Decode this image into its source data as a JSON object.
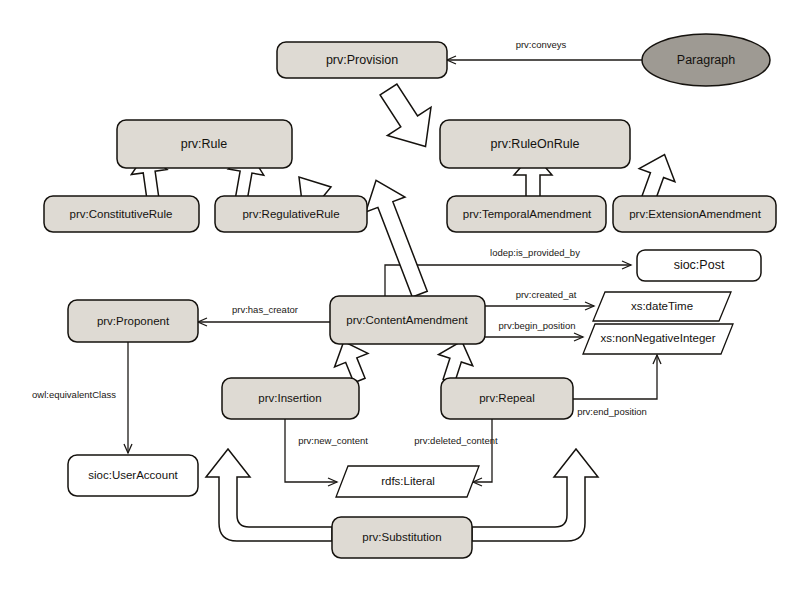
{
  "diagram": {
    "colors": {
      "class_fill": "#dedad3",
      "external_fill": "#ffffff",
      "individual_fill": "#9e9a93",
      "stroke": "#15120e",
      "background": "#ffffff"
    },
    "nodes": [
      {
        "id": "provision",
        "label": "prv:Provision",
        "shape": "rounded-rect",
        "fill": "class"
      },
      {
        "id": "paragraph",
        "label": "Paragraph",
        "shape": "ellipse",
        "fill": "individual"
      },
      {
        "id": "rule",
        "label": "prv:Rule",
        "shape": "rounded-rect",
        "fill": "class"
      },
      {
        "id": "ruleonrule",
        "label": "prv:RuleOnRule",
        "shape": "rounded-rect",
        "fill": "class"
      },
      {
        "id": "constitutiverule",
        "label": "prv:ConstitutiveRule",
        "shape": "rounded-rect",
        "fill": "class"
      },
      {
        "id": "regulativerule",
        "label": "prv:RegulativeRule",
        "shape": "rounded-rect",
        "fill": "class"
      },
      {
        "id": "temporalamendment",
        "label": "prv:TemporalAmendment",
        "shape": "rounded-rect",
        "fill": "class"
      },
      {
        "id": "extensionamendment",
        "label": "prv:ExtensionAmendment",
        "shape": "rounded-rect",
        "fill": "class"
      },
      {
        "id": "siocpost",
        "label": "sioc:Post",
        "shape": "rounded-rect",
        "fill": "external"
      },
      {
        "id": "contentamendment",
        "label": "prv:ContentAmendment",
        "shape": "rounded-rect",
        "fill": "class"
      },
      {
        "id": "proponent",
        "label": "prv:Proponent",
        "shape": "rounded-rect",
        "fill": "class"
      },
      {
        "id": "xsdatetime",
        "label": "xs:dateTime",
        "shape": "parallelogram",
        "fill": "external"
      },
      {
        "id": "xsnonnegativeinteger",
        "label": "xs:nonNegativeInteger",
        "shape": "parallelogram",
        "fill": "external"
      },
      {
        "id": "siocuseraccount",
        "label": "sioc:UserAccount",
        "shape": "rounded-rect",
        "fill": "external"
      },
      {
        "id": "insertion",
        "label": "prv:Insertion",
        "shape": "rounded-rect",
        "fill": "class"
      },
      {
        "id": "repeal",
        "label": "prv:Repeal",
        "shape": "rounded-rect",
        "fill": "class"
      },
      {
        "id": "rdfsliteral",
        "label": "rdfs:Literal",
        "shape": "parallelogram",
        "fill": "external"
      },
      {
        "id": "substitution",
        "label": "prv:Substitution",
        "shape": "rounded-rect",
        "fill": "class"
      }
    ],
    "edges": [
      {
        "id": "conveys",
        "label": "prv:conveys",
        "from": "paragraph",
        "to": "provision",
        "type": "association"
      },
      {
        "id": "is_provided_by",
        "label": "lodep:is_provided_by",
        "from": "contentamendment",
        "to": "siocpost",
        "type": "association"
      },
      {
        "id": "created_at",
        "label": "prv:created_at",
        "from": "contentamendment",
        "to": "xsdatetime",
        "type": "association"
      },
      {
        "id": "begin_position",
        "label": "prv:begin_position",
        "from": "contentamendment",
        "to": "xsnonnegativeinteger",
        "type": "association"
      },
      {
        "id": "end_position",
        "label": "prv:end_position",
        "from": "repeal",
        "to": "xsnonnegativeinteger",
        "type": "association"
      },
      {
        "id": "has_creator",
        "label": "prv:has_creator",
        "from": "contentamendment",
        "to": "proponent",
        "type": "association"
      },
      {
        "id": "equivalent_class",
        "label": "owl:equivalentClass",
        "from": "proponent",
        "to": "siocuseraccount",
        "type": "association"
      },
      {
        "id": "new_content",
        "label": "prv:new_content",
        "from": "insertion",
        "to": "rdfsliteral",
        "type": "association"
      },
      {
        "id": "deleted_content",
        "label": "prv:deleted_content",
        "from": "repeal",
        "to": "rdfsliteral",
        "type": "association"
      },
      {
        "id": "gen-rule",
        "label": "",
        "from": "rule",
        "to": "provision",
        "type": "generalization"
      },
      {
        "id": "gen-ruleonrule",
        "label": "",
        "from": "ruleonrule",
        "to": "provision",
        "type": "generalization"
      },
      {
        "id": "gen-constitutive",
        "label": "",
        "from": "constitutiverule",
        "to": "rule",
        "type": "generalization"
      },
      {
        "id": "gen-regulative",
        "label": "",
        "from": "regulativerule",
        "to": "rule",
        "type": "generalization"
      },
      {
        "id": "gen-temporal",
        "label": "",
        "from": "temporalamendment",
        "to": "ruleonrule",
        "type": "generalization"
      },
      {
        "id": "gen-extension",
        "label": "",
        "from": "extensionamendment",
        "to": "ruleonrule",
        "type": "generalization"
      },
      {
        "id": "gen-contentamend",
        "label": "",
        "from": "contentamendment",
        "to": "ruleonrule",
        "type": "generalization"
      },
      {
        "id": "gen-insertion",
        "label": "",
        "from": "insertion",
        "to": "contentamendment",
        "type": "generalization"
      },
      {
        "id": "gen-repeal",
        "label": "",
        "from": "repeal",
        "to": "contentamendment",
        "type": "generalization"
      },
      {
        "id": "gen-subst-ins",
        "label": "",
        "from": "substitution",
        "to": "insertion",
        "type": "generalization"
      },
      {
        "id": "gen-subst-rep",
        "label": "",
        "from": "substitution",
        "to": "repeal",
        "type": "generalization"
      }
    ]
  }
}
